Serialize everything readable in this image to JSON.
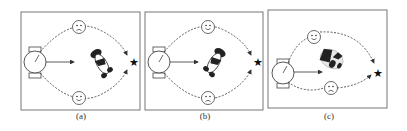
{
  "figure": {
    "panels": [
      {
        "id": "a",
        "caption": "(a)",
        "upper_face": "sad",
        "lower_face": "happy",
        "robot_orientation": "left",
        "human_pose": "facing-down-right"
      },
      {
        "id": "b",
        "caption": "(b)",
        "upper_face": "happy",
        "lower_face": "sad",
        "robot_orientation": "left",
        "human_pose": "facing-down-left"
      },
      {
        "id": "c",
        "caption": "(c)",
        "upper_face": "happy",
        "lower_face": "sad",
        "robot_orientation": "left-lower",
        "human_pose": "lying-tilted"
      }
    ],
    "goal_marker": "star-icon",
    "colors": {
      "stroke": "#333333",
      "frame": "#777777",
      "background": "#ffffff"
    }
  }
}
